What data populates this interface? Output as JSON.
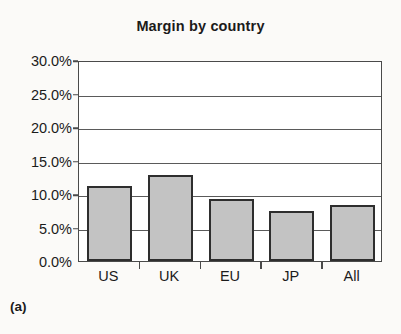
{
  "chart_data": {
    "type": "bar",
    "title": "Margin by country",
    "xlabel": "",
    "ylabel": "",
    "categories": [
      "US",
      "UK",
      "EU",
      "JP",
      "All"
    ],
    "values": [
      11.2,
      12.8,
      9.2,
      7.4,
      8.3
    ],
    "value_labels": [
      "11.2%",
      "12.8%",
      "9.2%",
      "7.4%",
      "8.3%"
    ],
    "ylim": [
      0,
      30
    ],
    "ytick_values": [
      0,
      5,
      10,
      15,
      20,
      25,
      30
    ],
    "ytick_labels": [
      "0.0%",
      "5.0%",
      "10.0%",
      "15.0%",
      "20.0%",
      "25.0%",
      "30.0%"
    ],
    "grid": true,
    "legend": false,
    "legend_position": "none",
    "bar_fill_color": "#c3c3c3",
    "bar_edge_color": "#2e2e2e",
    "axis_color": "#4a4a4a",
    "background_color": "#fbfaf8",
    "plot_background_color": "#ffffff"
  },
  "figure": {
    "caption": "(a)"
  }
}
